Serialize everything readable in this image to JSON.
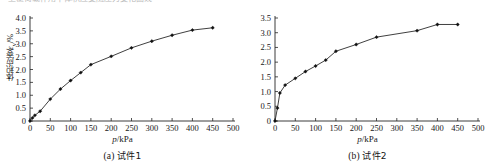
{
  "page": {
    "clipped_header_text": "上覆荷载作用下体积应变随压力变化曲线"
  },
  "figures": [
    {
      "id": "fig-a",
      "caption": "(a) 试件1",
      "caption_label": "(a)",
      "caption_name": "试件1",
      "ylabel": "体积应变",
      "ylabel_symbol": "εv",
      "ylabel_unit": "/%",
      "xlabel": "p/kPa"
    },
    {
      "id": "fig-b",
      "caption": "(b) 试件2",
      "caption_label": "(b)",
      "caption_name": "试件2",
      "ylabel": "体积应变",
      "ylabel_symbol": "εv",
      "ylabel_unit": "/%",
      "xlabel": "p/kPa"
    }
  ],
  "chart_data": [
    {
      "type": "line",
      "title": "(a) 试件1",
      "xlabel": "p/kPa",
      "ylabel": "体积应变εv/%",
      "xlim": [
        0,
        500
      ],
      "ylim": [
        0,
        4.0
      ],
      "xticks": [
        0,
        50,
        100,
        150,
        200,
        250,
        300,
        350,
        400,
        450,
        500
      ],
      "xticklabels": [
        "0",
        "50",
        "100",
        "150",
        "200",
        "250",
        "300",
        "350",
        "400",
        "450",
        "500"
      ],
      "yticks": [
        0,
        0.5,
        1.0,
        1.5,
        2.0,
        2.5,
        3.0,
        3.5,
        4.0
      ],
      "yticklabels": [
        "0",
        "0.5",
        "1.0",
        "1.5",
        "2.0",
        "2.5",
        "3.0",
        "3.5",
        "4.0"
      ],
      "grid": false,
      "legend": null,
      "marker": "filled-diamond",
      "series": [
        {
          "name": "试件1",
          "x": [
            0,
            6,
            12,
            25,
            50,
            75,
            100,
            125,
            150,
            200,
            250,
            300,
            350,
            400,
            450
          ],
          "y": [
            0.0,
            0.12,
            0.22,
            0.38,
            0.85,
            1.24,
            1.57,
            1.88,
            2.19,
            2.51,
            2.84,
            3.1,
            3.33,
            3.53,
            3.62
          ]
        }
      ]
    },
    {
      "type": "line",
      "title": "(b) 试件2",
      "xlabel": "p/kPa",
      "ylabel": "体积应变εv/%",
      "xlim": [
        0,
        500
      ],
      "ylim": [
        0,
        3.5
      ],
      "xticks": [
        0,
        50,
        100,
        150,
        200,
        250,
        300,
        350,
        400,
        450,
        500
      ],
      "xticklabels": [
        "0",
        "50",
        "100",
        "150",
        "200",
        "250",
        "300",
        "350",
        "400",
        "450",
        "500"
      ],
      "yticks": [
        0,
        0.5,
        1.0,
        1.5,
        2.0,
        2.5,
        3.0,
        3.5
      ],
      "yticklabels": [
        "0",
        "0.5",
        "1.0",
        "1.5",
        "2.0",
        "2.5",
        "3.0",
        "3.5"
      ],
      "grid": false,
      "legend": null,
      "marker": "filled-diamond",
      "series": [
        {
          "name": "试件2",
          "x": [
            0,
            6,
            12,
            25,
            50,
            75,
            100,
            125,
            150,
            200,
            250,
            350,
            400,
            450
          ],
          "y": [
            0.0,
            0.44,
            0.95,
            1.22,
            1.45,
            1.68,
            1.87,
            2.07,
            2.37,
            2.6,
            2.85,
            3.07,
            3.28,
            3.28
          ]
        }
      ]
    }
  ],
  "style": {
    "axis_color": "#262626",
    "line_color": "#2a2a2a",
    "marker_color": "#111111",
    "text_color": "#181818",
    "background": "#ffffff"
  }
}
